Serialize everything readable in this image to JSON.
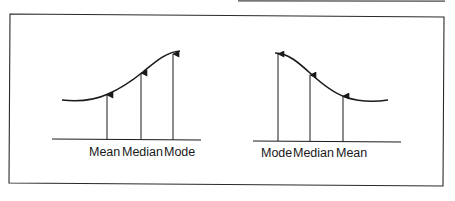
{
  "colors": {
    "ink": "#1a1a1a",
    "frame": "#2a2a2a",
    "background": "#ffffff"
  },
  "figure": {
    "panels": [
      {
        "name": "negative-skew",
        "labels": [
          "Mean",
          "Median",
          "Mode"
        ]
      },
      {
        "name": "positive-skew",
        "labels": [
          "Mode",
          "Median",
          "Mean"
        ]
      }
    ]
  }
}
